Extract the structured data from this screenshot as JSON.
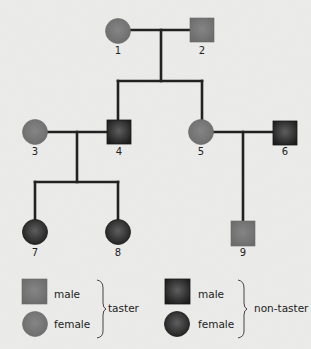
{
  "title_fragment": "",
  "colors": {
    "background": "#ececea",
    "taster": "#7c7c7c",
    "taster_edge": "#6a6a6a",
    "non_taster_center": "#5a5a5a",
    "non_taster_edge": "#1e1e1e",
    "line": "#222222"
  },
  "individuals": [
    {
      "id": "1",
      "label": "1",
      "sex": "female",
      "phenotype": "taster",
      "generation": 1
    },
    {
      "id": "2",
      "label": "2",
      "sex": "male",
      "phenotype": "taster",
      "generation": 1
    },
    {
      "id": "3",
      "label": "3",
      "sex": "female",
      "phenotype": "taster",
      "generation": 2
    },
    {
      "id": "4",
      "label": "4",
      "sex": "male",
      "phenotype": "non-taster",
      "generation": 2
    },
    {
      "id": "5",
      "label": "5",
      "sex": "female",
      "phenotype": "taster",
      "generation": 2
    },
    {
      "id": "6",
      "label": "6",
      "sex": "male",
      "phenotype": "non-taster",
      "generation": 2
    },
    {
      "id": "7",
      "label": "7",
      "sex": "female",
      "phenotype": "non-taster",
      "generation": 3
    },
    {
      "id": "8",
      "label": "8",
      "sex": "female",
      "phenotype": "non-taster",
      "generation": 3
    },
    {
      "id": "9",
      "label": "9",
      "sex": "male",
      "phenotype": "taster",
      "generation": 3
    }
  ],
  "matings": [
    {
      "parents": [
        "1",
        "2"
      ],
      "children": [
        "4",
        "5"
      ]
    },
    {
      "parents": [
        "3",
        "4"
      ],
      "children": [
        "7",
        "8"
      ]
    },
    {
      "parents": [
        "5",
        "6"
      ],
      "children": [
        "9"
      ]
    }
  ],
  "legend": {
    "taster": {
      "male_label": "male",
      "female_label": "female",
      "group_label": "taster"
    },
    "non_taster": {
      "male_label": "male",
      "female_label": "female",
      "group_label": "non-taster"
    }
  }
}
